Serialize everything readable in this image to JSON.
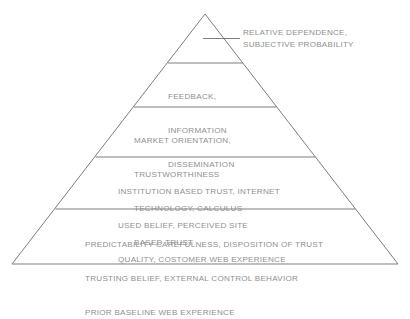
{
  "diagram": {
    "type": "pyramid",
    "text_color": "#8f8f8f",
    "line_color": "#7d7d7d",
    "background_color": "#ffffff",
    "callout": {
      "lines": [
        "RELATIVE DEPENDENCE,",
        "SUBJECTIVE PROBABILITY"
      ]
    },
    "bands": [
      {
        "id": "band-1-apex",
        "level": 1,
        "lines": []
      },
      {
        "id": "band-2-feedback",
        "level": 2,
        "lines": [
          "FEEDBACK,",
          "INFORMATION",
          "DISSEMINATION"
        ]
      },
      {
        "id": "band-3-market-orientation",
        "level": 3,
        "lines": [
          "MARKET ORIENTATION,",
          "TRUSTWORTHINESS",
          "TECHNOLOGY, CALCULUS",
          "BASED TRUST"
        ]
      },
      {
        "id": "band-4-institution-based-trust",
        "level": 4,
        "lines": [
          "INSTITUTION BASED TRUST, INTERNET",
          "USED BELIEF, PERCEIVED SITE",
          "QUALITY, COSTOMER WEB EXPERIENCE"
        ]
      },
      {
        "id": "band-5-predictability",
        "level": 5,
        "lines": [
          "PREDICTABILITY CAREFULNESS, DISPOSITION OF TRUST",
          "TRUSTING BELIEF, EXTERNAL CONTROL BEHAVIOR",
          "PRIOR BASELINE WEB EXPERIENCE"
        ]
      }
    ],
    "geometry": {
      "apex_x": 205,
      "apex_y": 14,
      "base_left_x": 12,
      "base_right_x": 398,
      "base_y": 264,
      "divider_y": [
        63,
        107,
        157,
        209
      ],
      "leader_line_y": 38,
      "leader_line_x1": 203,
      "leader_line_x2": 240
    }
  }
}
